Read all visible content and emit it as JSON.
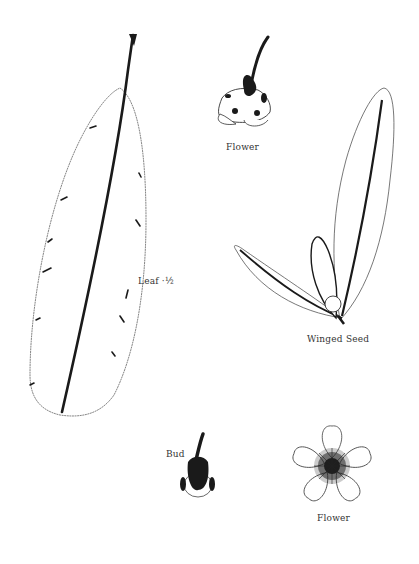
{
  "diagram": {
    "type": "botanical-illustration",
    "colors": {
      "ink": "#1a1a1a",
      "outline": "#555555",
      "background": "#ffffff"
    },
    "specimens": [
      {
        "id": "leaf",
        "label": "Leaf ·½"
      },
      {
        "id": "flower-side",
        "label": "Flower"
      },
      {
        "id": "winged-seed",
        "label": "Winged Seed"
      },
      {
        "id": "bud",
        "label": "Bud"
      },
      {
        "id": "flower-top",
        "label": "Flower"
      }
    ]
  }
}
